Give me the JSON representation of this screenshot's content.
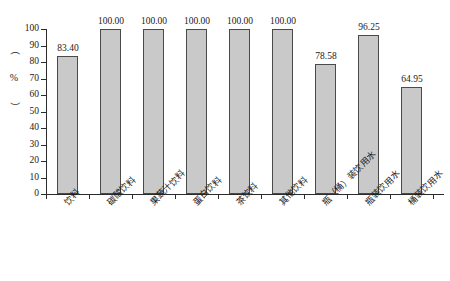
{
  "chart_data": {
    "type": "bar",
    "title": "",
    "xlabel": "",
    "ylabel": "（%）",
    "ylim": [
      0,
      100
    ],
    "yticks": [
      0,
      10,
      20,
      30,
      40,
      50,
      60,
      70,
      80,
      90,
      100
    ],
    "grid": false,
    "legend": "none",
    "categories": [
      "饮料",
      "碳酸饮料",
      "果蔬汁饮料",
      "蛋白饮料",
      "茶饮料",
      "其他饮料",
      "瓶（桶）装饮用水",
      "瓶装饮用水",
      "桶装饮用水"
    ],
    "values": [
      83.4,
      100.0,
      100.0,
      100.0,
      100.0,
      100.0,
      78.58,
      96.25,
      64.95
    ],
    "value_labels": [
      "83.40",
      "100.00",
      "100.00",
      "100.00",
      "100.00",
      "100.00",
      "78.58",
      "96.25",
      "64.95"
    ],
    "bar_color": "#c9c9c9",
    "bar_edge_color": "#4a4a4a",
    "axis_color": "#2b2b2b"
  },
  "axis": {
    "y_title_open_paren": "（",
    "y_title_symbol": "%",
    "y_title_close_paren": "）",
    "tick_labels": [
      "100",
      "90",
      "80",
      "70",
      "60",
      "50",
      "40",
      "30",
      "20",
      "10",
      "0"
    ]
  }
}
